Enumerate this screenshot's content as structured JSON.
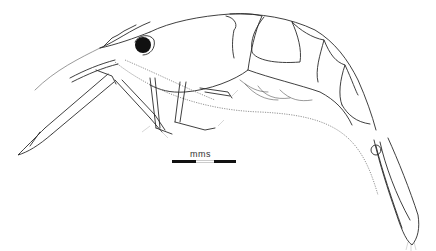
{
  "figure": {
    "colors": {
      "background": "#ffffff",
      "line": "#2a2a2a",
      "eye": "#111111"
    }
  },
  "scale_bar": {
    "label": "mms",
    "segments": [
      "black",
      "white",
      "black"
    ]
  }
}
